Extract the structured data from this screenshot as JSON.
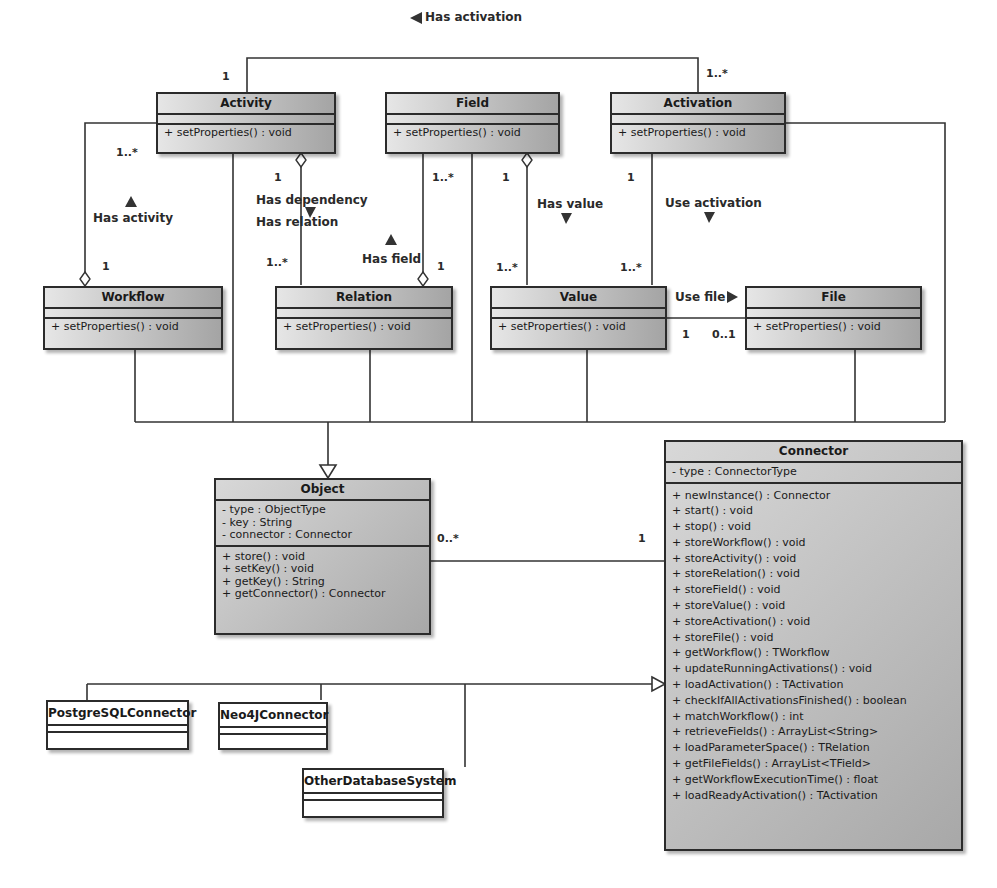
{
  "diagram": {
    "type": "UML class diagram",
    "classes": {
      "activity": {
        "name": "Activity",
        "operations": [
          "+ setProperties() : void"
        ]
      },
      "field": {
        "name": "Field",
        "operations": [
          "+ setProperties() : void"
        ]
      },
      "activation": {
        "name": "Activation",
        "operations": [
          "+ setProperties() : void"
        ]
      },
      "workflow": {
        "name": "Workflow",
        "operations": [
          "+ setProperties() : void"
        ]
      },
      "relation": {
        "name": "Relation",
        "operations": [
          "+ setProperties() : void"
        ]
      },
      "value": {
        "name": "Value",
        "operations": [
          "+ setProperties() : void"
        ]
      },
      "file": {
        "name": "File",
        "operations": [
          "+ setProperties() : void"
        ]
      },
      "object": {
        "name": "Object",
        "attributes": [
          "- type : ObjectType",
          "- key : String",
          "- connector : Connector"
        ],
        "operations": [
          "+ store() : void",
          "+ setKey() : void",
          "+ getKey() : String",
          "+ getConnector() : Connector"
        ]
      },
      "connector": {
        "name": "Connector",
        "attributes": [
          "- type : ConnectorType"
        ],
        "operations": [
          "+ newInstance() : Connector",
          "+ start() : void",
          "+ stop() : void",
          "+ storeWorkflow() : void",
          "+ storeActivity() : void",
          "+ storeRelation() : void",
          "+ storeField() : void",
          "+ storeValue() : void",
          "+ storeActivation() : void",
          "+ storeFile() : void",
          "+ getWorkflow() : TWorkflow",
          "+ updateRunningActivations() : void",
          "+ loadActivation() : TActivation",
          "+ checkIfAllActivationsFinished() : boolean",
          "+ matchWorkflow() : int",
          "+ retrieveFields() : ArrayList<String>",
          "+ loadParameterSpace() : TRelation",
          "+ getFileFields() : ArrayList<TField>",
          "+ getWorkflowExecutionTime() : float",
          "+ loadReadyActivation() : TActivation"
        ]
      },
      "postgres": {
        "name": "PostgreSQLConnector"
      },
      "neo4j": {
        "name": "Neo4JConnector"
      },
      "otherdb": {
        "name": "OtherDatabaseSystem"
      }
    },
    "associations": {
      "has_activation": {
        "label": "Has activation",
        "arrow": "left",
        "mult_activity": "1",
        "mult_activation": "1..*"
      },
      "has_activity": {
        "label": "Has activity",
        "arrow": "up",
        "mult_activity": "1..*",
        "mult_workflow": "1"
      },
      "has_dependency": {
        "label": "Has dependency",
        "label2": "Has relation",
        "arrow": "down",
        "mult_activity": "1",
        "mult_relation": "1..*"
      },
      "has_field": {
        "label": "Has field",
        "arrow": "up",
        "mult_field": "1..*",
        "mult_relation": "1"
      },
      "has_value": {
        "label": "Has value",
        "arrow": "down",
        "mult_field": "1",
        "mult_value": "1..*"
      },
      "use_activation": {
        "label": "Use activation",
        "arrow": "down",
        "mult_activation": "1",
        "mult_value": "1..*"
      },
      "use_file": {
        "label": "Use file",
        "arrow": "right",
        "mult_value": "1",
        "mult_file": "0..1"
      },
      "object_connector": {
        "mult_object": "0..*",
        "mult_connector": "1"
      }
    }
  }
}
